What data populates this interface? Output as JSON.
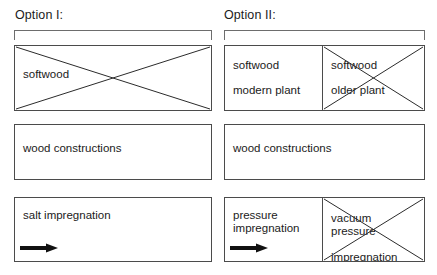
{
  "diagram": {
    "title_visible": false,
    "columns": [
      {
        "id": "option-1",
        "label": "Option I:",
        "rows": [
          {
            "id": "raw-material",
            "cells": [
              {
                "text": "softwood",
                "crossed_out": true,
                "has_arrow": false
              }
            ]
          },
          {
            "id": "product",
            "cells": [
              {
                "text": "wood constructions",
                "crossed_out": false,
                "has_arrow": false
              }
            ]
          },
          {
            "id": "treatment",
            "cells": [
              {
                "text": "salt impregnation",
                "crossed_out": false,
                "has_arrow": true
              }
            ]
          }
        ]
      },
      {
        "id": "option-2",
        "label": "Option II:",
        "rows": [
          {
            "id": "raw-material",
            "cells": [
              {
                "line1": "softwood",
                "line2": "modern plant",
                "crossed_out": false,
                "has_arrow": false
              },
              {
                "line1": "softwood",
                "line2": "older plant",
                "crossed_out": true,
                "has_arrow": false
              }
            ]
          },
          {
            "id": "product",
            "cells": [
              {
                "text": "wood constructions",
                "crossed_out": false,
                "has_arrow": false
              }
            ]
          },
          {
            "id": "treatment",
            "cells": [
              {
                "line1": "pressure",
                "line2": "impregnation",
                "crossed_out": false,
                "has_arrow": true
              },
              {
                "line1": "vacuum pressure",
                "line2": "impregnation",
                "crossed_out": true,
                "has_arrow": false
              }
            ]
          }
        ]
      }
    ],
    "colors": {
      "background": "#ffffff",
      "box_border": "#4b4b4b",
      "bracket": "#6d6d6d",
      "cross_line": "#2b2b2b",
      "arrow": "#111111",
      "text": "#1b1b1b"
    }
  }
}
